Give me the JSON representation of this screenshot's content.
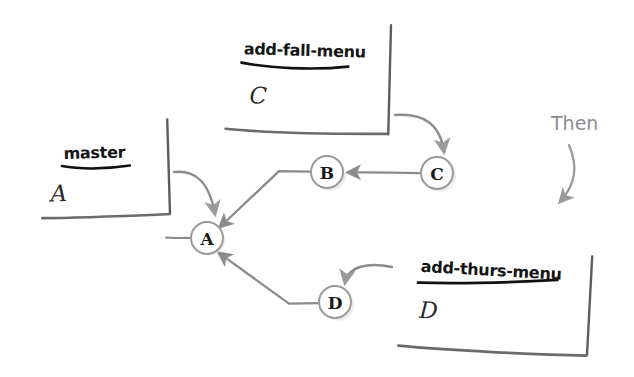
{
  "diagram": {
    "background_color": "#ffffff",
    "ink_color": "#1a1a1a",
    "line_color": "#8c8c8c",
    "annotation_color": "#8d8d8d"
  },
  "cards": [
    {
      "id": "card-master",
      "label": "master",
      "commit": "A",
      "x": 40,
      "y": 120,
      "w": 128,
      "h": 98,
      "rotate": -1.5
    },
    {
      "id": "card-add-fall-menu",
      "label": "add-fall-menu",
      "commit": "C",
      "x": 226,
      "y": 22,
      "w": 164,
      "h": 113,
      "rotate": 1.5
    },
    {
      "id": "card-add-thurs-menu",
      "label": "add-thurs-menu",
      "commit": "D",
      "x": 400,
      "y": 250,
      "w": 190,
      "h": 104,
      "rotate": 3.0
    }
  ],
  "nodes": [
    {
      "id": "node-a",
      "letter": "A",
      "cx": 207,
      "cy": 238,
      "r": 16
    },
    {
      "id": "node-b",
      "letter": "B",
      "cx": 327,
      "cy": 172,
      "r": 16
    },
    {
      "id": "node-c",
      "letter": "C",
      "cx": 437,
      "cy": 173,
      "r": 16
    },
    {
      "id": "node-d",
      "letter": "D",
      "cx": 335,
      "cy": 302,
      "r": 16
    }
  ],
  "edges": [
    {
      "id": "edge-b-to-a",
      "from": "B",
      "to": "A",
      "kind": "parent-pointer"
    },
    {
      "id": "edge-c-to-b",
      "from": "C",
      "to": "B",
      "kind": "parent-pointer"
    },
    {
      "id": "edge-d-to-a",
      "from": "D",
      "to": "A",
      "kind": "parent-pointer"
    },
    {
      "id": "edge-history-stub",
      "from": "",
      "to": "A",
      "kind": "history-stub"
    }
  ],
  "pointer_arrows": [
    {
      "id": "arrow-master-to-a",
      "from": "card-master",
      "to": "node-a"
    },
    {
      "id": "arrow-fall-to-c",
      "from": "card-add-fall-menu",
      "to": "node-c"
    },
    {
      "id": "arrow-thurs-to-d",
      "from": "card-add-thurs-menu",
      "to": "node-d"
    }
  ],
  "annotations": [
    {
      "id": "annotation-then",
      "text": "Then",
      "x": 551,
      "y": 130
    }
  ]
}
